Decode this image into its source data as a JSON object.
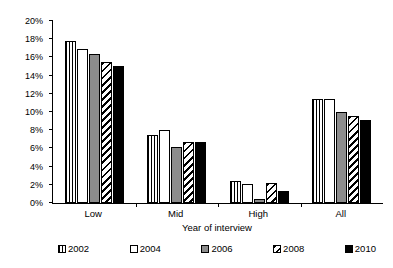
{
  "chart_data": {
    "type": "bar",
    "title": "",
    "xlabel": "Year of interview",
    "ylabel": "Percentage receiving DI",
    "categories": [
      "Low",
      "Mid",
      "High",
      "All"
    ],
    "ylim": [
      0,
      20
    ],
    "ytick_step": 2,
    "ytick_labels": [
      "0%",
      "2%",
      "4%",
      "6%",
      "8%",
      "10%",
      "12%",
      "14%",
      "16%",
      "18%",
      "20%"
    ],
    "yticks": [
      0,
      2,
      4,
      6,
      8,
      10,
      12,
      14,
      16,
      18,
      20
    ],
    "y_unit": "%",
    "grid": false,
    "legend_position": "bottom",
    "series": [
      {
        "name": "2002",
        "fill": "vertical-stripes",
        "values": [
          17.8,
          7.5,
          2.4,
          11.4
        ]
      },
      {
        "name": "2004",
        "fill": "white",
        "values": [
          16.9,
          8.0,
          2.1,
          11.4
        ]
      },
      {
        "name": "2006",
        "fill": "gray",
        "values": [
          16.4,
          6.2,
          0.4,
          10.0
        ]
      },
      {
        "name": "2008",
        "fill": "diagonal-hatch",
        "values": [
          15.5,
          6.7,
          2.2,
          9.6
        ]
      },
      {
        "name": "2010",
        "fill": "black",
        "values": [
          15.1,
          6.7,
          1.3,
          9.1
        ]
      }
    ]
  },
  "colors": {
    "axis": "#000000",
    "gray_fill": "#8c8c8c",
    "black_fill": "#000000",
    "white_fill": "#ffffff",
    "background": "#ffffff"
  }
}
